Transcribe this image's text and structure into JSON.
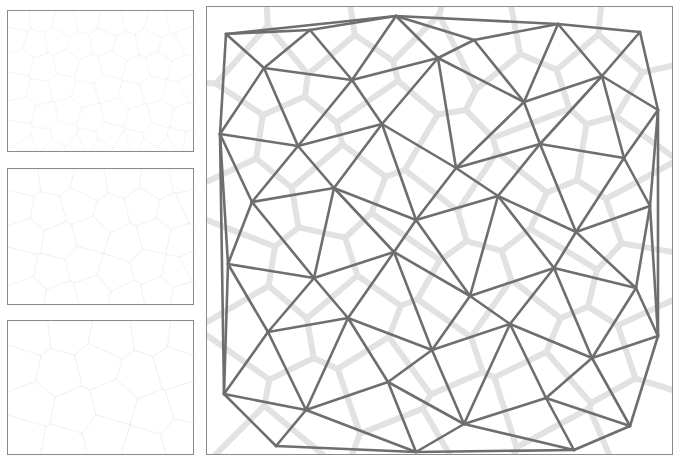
{
  "figure": {
    "title": "",
    "background_color": "#ffffff",
    "width": 677,
    "height": 462
  },
  "colors": {
    "panel_border": "#8a8a8a",
    "delaunay_edge": "#6e6e6e",
    "voronoi_edge": "#e2e2e2",
    "voronoi_edge_thumb": "#ededed",
    "background": "#ffffff"
  },
  "panels": [
    {
      "name": "thumbnail-voronoi-fine",
      "index": 1,
      "diagram_type": "voronoi",
      "label": "",
      "seed_count": 120,
      "edge_color": "#ededed",
      "edge_width": 0.6,
      "border_color": "#8a8a8a",
      "x": 7,
      "y": 10,
      "width": 187,
      "height": 142
    },
    {
      "name": "thumbnail-voronoi-medium",
      "index": 2,
      "diagram_type": "voronoi",
      "label": "",
      "seed_count": 60,
      "edge_color": "#ebebeb",
      "edge_width": 0.7,
      "border_color": "#8a8a8a",
      "x": 7,
      "y": 168,
      "width": 187,
      "height": 137
    },
    {
      "name": "thumbnail-voronoi-coarse",
      "index": 3,
      "diagram_type": "voronoi",
      "label": "",
      "seed_count": 30,
      "edge_color": "#ebebeb",
      "edge_width": 0.8,
      "border_color": "#8a8a8a",
      "x": 7,
      "y": 320,
      "width": 187,
      "height": 135
    },
    {
      "name": "main-delaunay-voronoi",
      "index": 4,
      "diagram_type": "delaunay-with-voronoi-overlay",
      "label": "",
      "seed_count": 45,
      "delaunay_edge_color": "#6e6e6e",
      "delaunay_edge_width": 2.6,
      "voronoi_edge_color": "#e2e2e2",
      "voronoi_edge_width": 6,
      "border_color": "#8a8a8a",
      "x": 206,
      "y": 6,
      "width": 467,
      "height": 449
    }
  ],
  "chart_data": {
    "type": "scatter",
    "title": "",
    "xlabel": "",
    "ylabel": "",
    "grid": false,
    "legend": "none",
    "main_points": [
      [
        20,
        28
      ],
      [
        104,
        24
      ],
      [
        190,
        10
      ],
      [
        268,
        34
      ],
      [
        352,
        18
      ],
      [
        434,
        26
      ],
      [
        58,
        62
      ],
      [
        146,
        74
      ],
      [
        232,
        52
      ],
      [
        318,
        96
      ],
      [
        396,
        70
      ],
      [
        452,
        104
      ],
      [
        14,
        128
      ],
      [
        92,
        140
      ],
      [
        176,
        118
      ],
      [
        250,
        162
      ],
      [
        334,
        138
      ],
      [
        418,
        152
      ],
      [
        46,
        196
      ],
      [
        128,
        182
      ],
      [
        210,
        214
      ],
      [
        292,
        190
      ],
      [
        370,
        226
      ],
      [
        444,
        200
      ],
      [
        22,
        258
      ],
      [
        108,
        272
      ],
      [
        188,
        246
      ],
      [
        264,
        290
      ],
      [
        348,
        262
      ],
      [
        430,
        282
      ],
      [
        62,
        326
      ],
      [
        142,
        312
      ],
      [
        226,
        344
      ],
      [
        304,
        318
      ],
      [
        386,
        352
      ],
      [
        452,
        330
      ],
      [
        18,
        388
      ],
      [
        100,
        404
      ],
      [
        182,
        376
      ],
      [
        258,
        418
      ],
      [
        340,
        392
      ],
      [
        424,
        420
      ],
      [
        70,
        440
      ],
      [
        210,
        446
      ],
      [
        368,
        444
      ]
    ],
    "thumb1_points": [
      [
        12,
        10
      ],
      [
        34,
        8
      ],
      [
        58,
        14
      ],
      [
        80,
        9
      ],
      [
        104,
        13
      ],
      [
        128,
        8
      ],
      [
        150,
        15
      ],
      [
        172,
        10
      ],
      [
        8,
        28
      ],
      [
        28,
        34
      ],
      [
        50,
        30
      ],
      [
        72,
        36
      ],
      [
        96,
        31
      ],
      [
        118,
        37
      ],
      [
        142,
        32
      ],
      [
        164,
        38
      ],
      [
        180,
        29
      ],
      [
        14,
        52
      ],
      [
        36,
        58
      ],
      [
        60,
        53
      ],
      [
        82,
        60
      ],
      [
        106,
        54
      ],
      [
        130,
        61
      ],
      [
        152,
        55
      ],
      [
        174,
        60
      ],
      [
        10,
        76
      ],
      [
        32,
        82
      ],
      [
        54,
        77
      ],
      [
        78,
        84
      ],
      [
        100,
        78
      ],
      [
        124,
        85
      ],
      [
        146,
        79
      ],
      [
        168,
        84
      ],
      [
        182,
        76
      ],
      [
        16,
        100
      ],
      [
        38,
        106
      ],
      [
        62,
        101
      ],
      [
        84,
        108
      ],
      [
        108,
        102
      ],
      [
        132,
        109
      ],
      [
        154,
        103
      ],
      [
        176,
        108
      ],
      [
        12,
        124
      ],
      [
        34,
        130
      ],
      [
        56,
        125
      ],
      [
        80,
        132
      ],
      [
        102,
        126
      ],
      [
        126,
        133
      ],
      [
        148,
        127
      ],
      [
        170,
        132
      ],
      [
        20,
        136
      ],
      [
        46,
        139
      ],
      [
        70,
        137
      ],
      [
        94,
        140
      ],
      [
        118,
        136
      ],
      [
        140,
        139
      ],
      [
        162,
        137
      ],
      [
        184,
        134
      ]
    ],
    "thumb2_points": [
      [
        16,
        12
      ],
      [
        48,
        8
      ],
      [
        82,
        16
      ],
      [
        116,
        10
      ],
      [
        150,
        14
      ],
      [
        178,
        9
      ],
      [
        10,
        38
      ],
      [
        40,
        44
      ],
      [
        72,
        36
      ],
      [
        104,
        46
      ],
      [
        136,
        38
      ],
      [
        166,
        44
      ],
      [
        184,
        36
      ],
      [
        20,
        68
      ],
      [
        52,
        74
      ],
      [
        84,
        66
      ],
      [
        118,
        76
      ],
      [
        148,
        68
      ],
      [
        176,
        74
      ],
      [
        12,
        98
      ],
      [
        44,
        104
      ],
      [
        76,
        96
      ],
      [
        108,
        106
      ],
      [
        142,
        98
      ],
      [
        170,
        104
      ],
      [
        186,
        96
      ],
      [
        22,
        126
      ],
      [
        54,
        132
      ],
      [
        86,
        124
      ],
      [
        120,
        131
      ],
      [
        152,
        125
      ],
      [
        178,
        130
      ]
    ],
    "thumb3_points": [
      [
        22,
        14
      ],
      [
        62,
        10
      ],
      [
        104,
        18
      ],
      [
        146,
        12
      ],
      [
        178,
        16
      ],
      [
        12,
        46
      ],
      [
        50,
        54
      ],
      [
        92,
        44
      ],
      [
        132,
        56
      ],
      [
        168,
        46
      ],
      [
        26,
        84
      ],
      [
        66,
        92
      ],
      [
        108,
        82
      ],
      [
        148,
        94
      ],
      [
        180,
        84
      ],
      [
        16,
        118
      ],
      [
        56,
        126
      ],
      [
        98,
        116
      ],
      [
        138,
        128
      ],
      [
        174,
        118
      ]
    ]
  }
}
